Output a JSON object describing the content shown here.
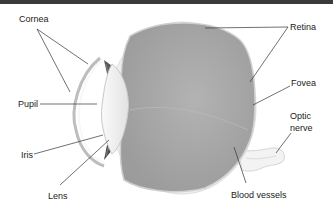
{
  "diagram": {
    "labels": {
      "cornea": "Cornea",
      "pupil": "Pupil",
      "iris": "Iris",
      "lens": "Lens",
      "retina": "Retina",
      "fovea": "Fovea",
      "optic_nerve_line1": "Optic",
      "optic_nerve_line2": "nerve",
      "blood_vessels": "Blood vessels"
    },
    "colors": {
      "top_bar": "#3a3a3a",
      "vitreous": "#a9a9a9",
      "sclera": "#ececec",
      "leader_line": "#333333",
      "text": "#222222"
    }
  }
}
